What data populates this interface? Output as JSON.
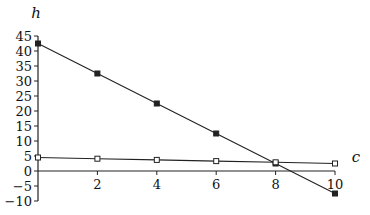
{
  "chart_data": {
    "type": "line",
    "title": "",
    "xlabel": "c",
    "ylabel": "h",
    "xlim": [
      0,
      10
    ],
    "ylim": [
      -10,
      45
    ],
    "x_ticks": [
      2,
      4,
      6,
      8,
      10
    ],
    "y_ticks": [
      -10,
      -5,
      0,
      5,
      10,
      15,
      20,
      25,
      30,
      35,
      40,
      45
    ],
    "grid": false,
    "legend": "none",
    "x": [
      0,
      2,
      4,
      6,
      8,
      10
    ],
    "series": [
      {
        "name": "filled-square series",
        "marker": "filled-square",
        "values": [
          42.5,
          32.5,
          22.5,
          12.5,
          2.5,
          -7.5
        ]
      },
      {
        "name": "open-square series",
        "marker": "open-square",
        "values": [
          4.5,
          4.1,
          3.7,
          3.3,
          2.9,
          2.5
        ]
      }
    ]
  },
  "colors": {
    "line": "#222222",
    "text": "#111111",
    "background": "#ffffff"
  }
}
